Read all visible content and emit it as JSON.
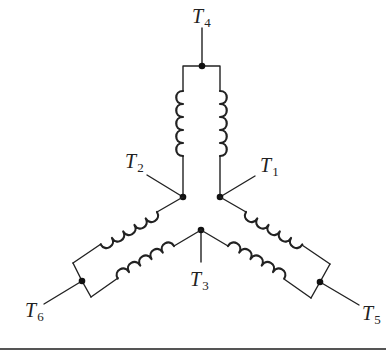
{
  "diagram": {
    "colors": {
      "line": "#222222",
      "node": "#111111",
      "background": "#ffffff"
    },
    "terminals": [
      {
        "id": "T1",
        "letter": "T",
        "sub": "1"
      },
      {
        "id": "T2",
        "letter": "T",
        "sub": "2"
      },
      {
        "id": "T3",
        "letter": "T",
        "sub": "3"
      },
      {
        "id": "T4",
        "letter": "T",
        "sub": "4"
      },
      {
        "id": "T5",
        "letter": "T",
        "sub": "5"
      },
      {
        "id": "T6",
        "letter": "T",
        "sub": "6"
      }
    ],
    "branches": [
      {
        "name": "top-branch",
        "from": "T4",
        "to": [
          "T1",
          "T2"
        ],
        "coils": 2
      },
      {
        "name": "left-branch",
        "from": "T6",
        "to": [
          "T2",
          "T3"
        ],
        "coils": 2
      },
      {
        "name": "right-branch",
        "from": "T5",
        "to": [
          "T1",
          "T3"
        ],
        "coils": 2
      }
    ]
  }
}
